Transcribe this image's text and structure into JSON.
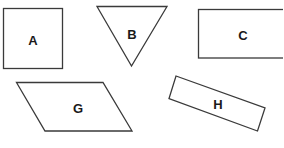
{
  "diagram": {
    "title": "",
    "stroke_color": "#3a3a3a",
    "label_color": "#1a1a1a",
    "background": "#ffffff",
    "shapes": [
      {
        "id": "A",
        "label": "A",
        "kind": "square"
      },
      {
        "id": "B",
        "label": "B",
        "kind": "inverted-triangle"
      },
      {
        "id": "C",
        "label": "C",
        "kind": "rectangle"
      },
      {
        "id": "G",
        "label": "G",
        "kind": "parallelogram"
      },
      {
        "id": "H",
        "label": "H",
        "kind": "rotated-rectangle"
      }
    ]
  }
}
